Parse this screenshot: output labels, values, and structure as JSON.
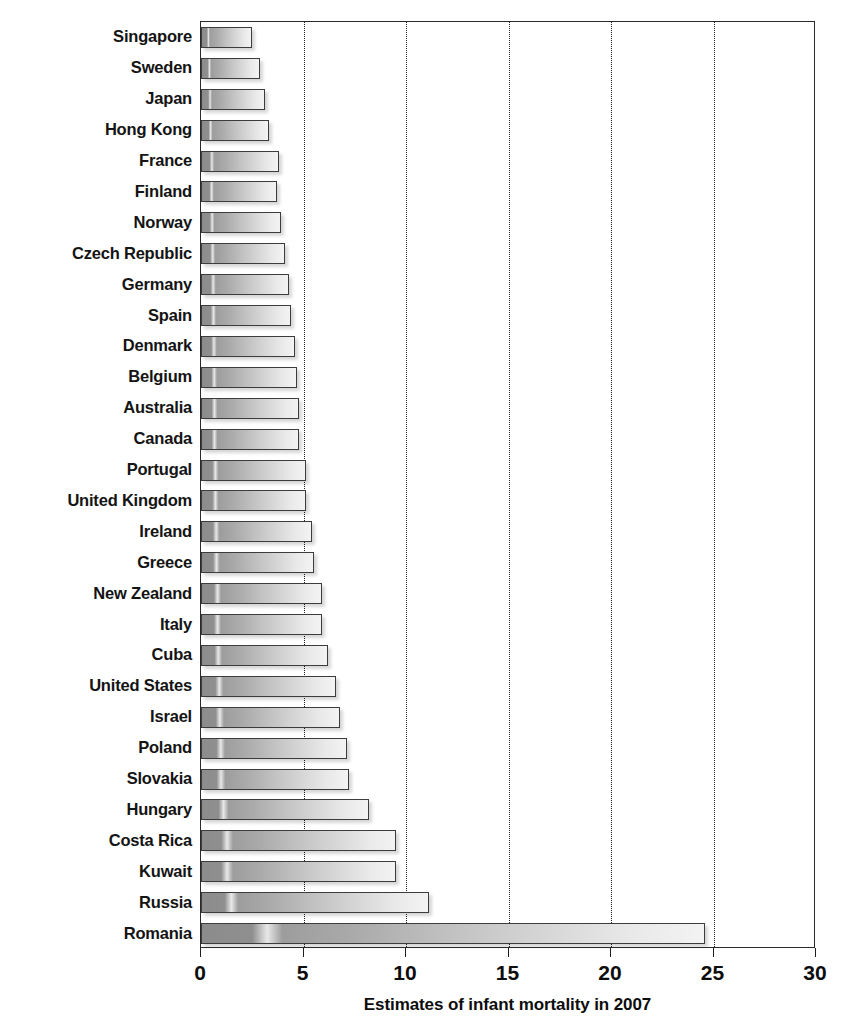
{
  "chart_data": {
    "type": "bar",
    "orientation": "horizontal",
    "title": "",
    "xlabel": "Estimates of infant mortality in 2007",
    "ylabel": "",
    "xlim": [
      0,
      30
    ],
    "xticks": [
      0,
      5,
      10,
      15,
      20,
      25,
      30
    ],
    "xtick_labels": [
      "0",
      "5",
      "10",
      "15",
      "20",
      "25",
      "30"
    ],
    "gridlines_at": [
      5,
      10,
      15,
      20,
      25
    ],
    "grid": true,
    "grid_style": "dotted-vertical",
    "legend": "none",
    "categories": [
      "Singapore",
      "Sweden",
      "Japan",
      "Hong Kong",
      "France",
      "Finland",
      "Norway",
      "Czech Republic",
      "Germany",
      "Spain",
      "Denmark",
      "Belgium",
      "Australia",
      "Canada",
      "Portugal",
      "United Kingdom",
      "Ireland",
      "Greece",
      "New Zealand",
      "Italy",
      "Cuba",
      "United States",
      "Israel",
      "Poland",
      "Slovakia",
      "Hungary",
      "Costa Rica",
      "Kuwait",
      "Russia",
      "Romania"
    ],
    "values": [
      2.5,
      2.9,
      3.1,
      3.3,
      3.8,
      3.7,
      3.9,
      4.1,
      4.3,
      4.4,
      4.6,
      4.7,
      4.8,
      4.8,
      5.1,
      5.1,
      5.4,
      5.5,
      5.9,
      5.9,
      6.2,
      6.6,
      6.8,
      7.1,
      7.2,
      8.2,
      9.5,
      9.5,
      11.1,
      24.6
    ],
    "bar_fill": "#b4b4b4",
    "bar_border_color": "#3c3c3c",
    "axis_color": "#2a2a2a"
  },
  "axis": {
    "x_title": "Estimates of infant mortality in 2007"
  }
}
